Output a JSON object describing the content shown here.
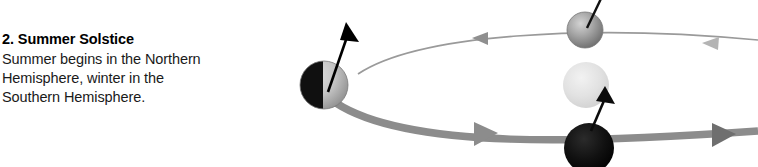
{
  "caption": {
    "title": "2. Summer Solstice",
    "lines": [
      "Summer begins in the Northern",
      "Hemisphere, winter in the",
      "Southern Hemisphere."
    ]
  },
  "diagram": {
    "name": "earth-orbit-summer-solstice-diagram",
    "colors": {
      "orbit_far_line": "#9a9a9a",
      "orbit_near_band": "#8c8c8c",
      "axis_line": "#000000",
      "earth_night": "#101010",
      "earth_day": "#c9c9c9",
      "sphere_gray": "#9b9b9b",
      "sphere_pale": "#e2e2e2",
      "sphere_black": "#0d0d0d"
    },
    "elements": [
      {
        "name": "earth-solstice-left",
        "label": "Earth at summer solstice",
        "shading": "left half night, right half day"
      },
      {
        "name": "earth-axis-arrow-left",
        "label": "Rotation axis",
        "tilt_degrees": 23.5
      },
      {
        "name": "orbit-far-arc",
        "label": "Far half of orbit",
        "direction": "left"
      },
      {
        "name": "orbit-near-band",
        "label": "Near half of orbit",
        "direction": "right"
      },
      {
        "name": "sphere-gray-top",
        "label": "Earth position gray"
      },
      {
        "name": "sphere-pale-middle",
        "label": "Earth position pale"
      },
      {
        "name": "sphere-black-bottom",
        "label": "Earth position black"
      }
    ]
  }
}
